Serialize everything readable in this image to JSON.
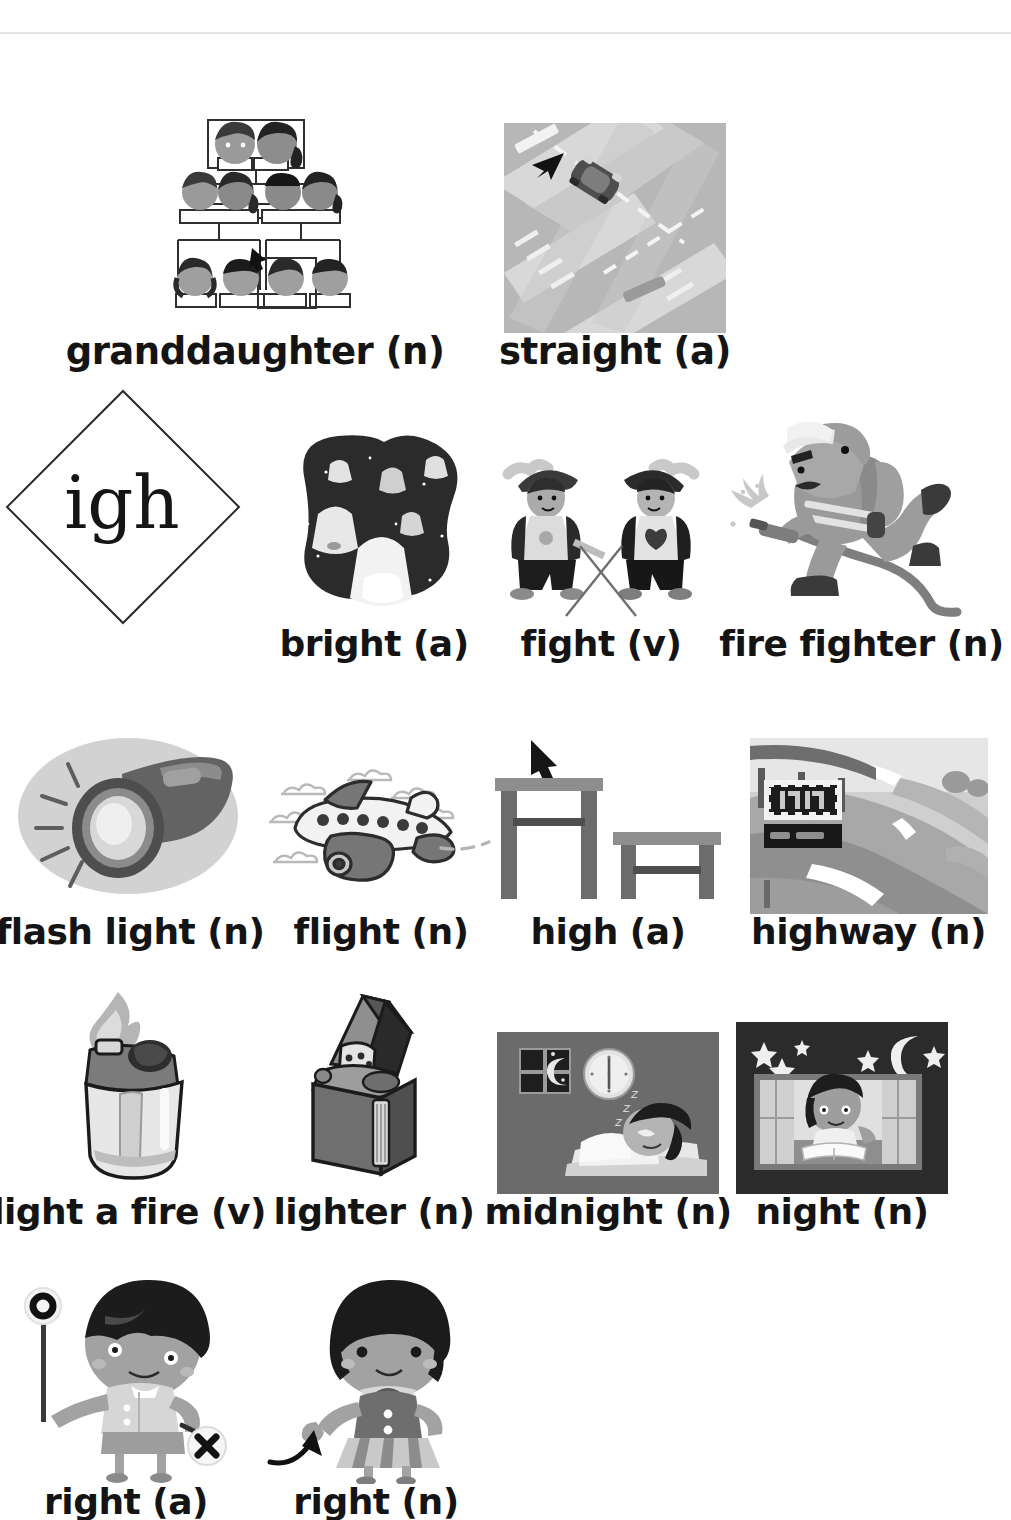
{
  "page": {
    "phoneme": "igh",
    "rule_visible": true
  },
  "entries": [
    {
      "id": "granddaughter",
      "label": "granddaughter (n)",
      "pos": "n",
      "word": "granddaughter",
      "icon": "family-tree-illustration"
    },
    {
      "id": "straight",
      "label": "straight (a)",
      "pos": "a",
      "word": "straight",
      "icon": "car-on-straight-road-photo"
    },
    {
      "id": "bright",
      "label": "bright (a)",
      "pos": "a",
      "word": "bright",
      "icon": "sky-lanterns-night-illustration"
    },
    {
      "id": "fight",
      "label": "fight (v)",
      "pos": "v",
      "word": "fight",
      "icon": "two-swordsmen-fighting-illustration"
    },
    {
      "id": "fire-fighter",
      "label": "fire fighter (n)",
      "pos": "n",
      "word": "fire fighter",
      "icon": "firefighter-with-hose-illustration"
    },
    {
      "id": "flash-light",
      "label": "flash light (n)",
      "pos": "n",
      "word": "flash light",
      "icon": "flashlight-illustration"
    },
    {
      "id": "flight",
      "label": "flight (n)",
      "pos": "n",
      "word": "flight",
      "icon": "airplane-in-clouds-illustration"
    },
    {
      "id": "high",
      "label": "high (a)",
      "pos": "a",
      "word": "high",
      "icon": "tall-and-short-table-illustration"
    },
    {
      "id": "highway",
      "label": "highway (n)",
      "pos": "n",
      "word": "highway",
      "icon": "highway-with-sign-gantry-photo"
    },
    {
      "id": "light-a-fire",
      "label": "light a fire (v)",
      "pos": "v",
      "word": "light a fire",
      "icon": "disposable-lighter-flame-illustration"
    },
    {
      "id": "lighter",
      "label": "lighter (n)",
      "pos": "n",
      "word": "lighter",
      "icon": "zippo-lighter-illustration"
    },
    {
      "id": "midnight",
      "label": "midnight (n)",
      "pos": "n",
      "word": "midnight",
      "icon": "child-sleeping-clock-illustration"
    },
    {
      "id": "night",
      "label": "night (n)",
      "pos": "n",
      "word": "night",
      "icon": "boy-reading-at-window-night-illustration"
    },
    {
      "id": "right-a",
      "label": "right (a)",
      "pos": "a",
      "word": "right",
      "icon": "boy-with-o-and-x-signs-illustration"
    },
    {
      "id": "right-n",
      "label": "right (n)",
      "pos": "n",
      "word": "right",
      "icon": "girl-pointing-right-illustration"
    }
  ],
  "colors": {
    "ink": "#141414",
    "rule": "#e2e2e2",
    "mid_gray": "#8f8f8f",
    "dark_gray": "#4a4a4a",
    "light_gray": "#c9c9c9",
    "night_dark": "#3d3d3d",
    "night_darker": "#262626"
  }
}
